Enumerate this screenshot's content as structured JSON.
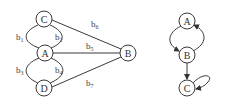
{
  "left_graph": {
    "nodes": [
      {
        "id": "C",
        "label": "C",
        "x": 44,
        "y": 19
      },
      {
        "id": "A",
        "label": "A",
        "x": 45,
        "y": 53
      },
      {
        "id": "D",
        "label": "D",
        "x": 44,
        "y": 88
      },
      {
        "id": "B",
        "label": "B",
        "x": 128,
        "y": 53
      }
    ],
    "edges": [
      {
        "id": "b1",
        "base": "b",
        "sub": "1",
        "from": "C",
        "to": "A"
      },
      {
        "id": "b2",
        "base": "b",
        "sub": "2",
        "from": "C",
        "to": "A"
      },
      {
        "id": "b3",
        "base": "b",
        "sub": "3",
        "from": "A",
        "to": "D"
      },
      {
        "id": "b4",
        "base": "b",
        "sub": "4",
        "from": "A",
        "to": "D"
      },
      {
        "id": "b5",
        "base": "b",
        "sub": "5",
        "from": "A",
        "to": "B"
      },
      {
        "id": "b6",
        "base": "b",
        "sub": "6",
        "from": "C",
        "to": "B"
      },
      {
        "id": "b7",
        "base": "b",
        "sub": "7",
        "from": "D",
        "to": "B"
      }
    ]
  },
  "right_graph": {
    "nodes": [
      {
        "id": "A",
        "label": "A",
        "x": 187,
        "y": 21
      },
      {
        "id": "B",
        "label": "B",
        "x": 187,
        "y": 55
      },
      {
        "id": "C",
        "label": "C",
        "x": 187,
        "y": 88
      }
    ],
    "edges": [
      {
        "from": "A",
        "to": "B",
        "directed": true
      },
      {
        "from": "B",
        "to": "A",
        "directed": true
      },
      {
        "from": "B",
        "to": "C",
        "directed": true
      },
      {
        "from": "C",
        "to": "C",
        "directed": true,
        "self_loop": true
      }
    ]
  }
}
